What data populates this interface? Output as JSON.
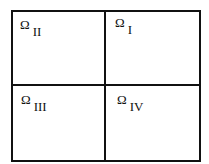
{
  "diagram": {
    "type": "domain-partition",
    "grid": {
      "rows": 2,
      "cols": 2
    },
    "regions": [
      {
        "position": "top-left",
        "symbol": "Ω",
        "subscript": "II"
      },
      {
        "position": "top-right",
        "symbol": "Ω",
        "subscript": "I"
      },
      {
        "position": "bottom-left",
        "symbol": "Ω",
        "subscript": "III"
      },
      {
        "position": "bottom-right",
        "symbol": "Ω",
        "subscript": "IV"
      }
    ],
    "colors": {
      "line": "#111111",
      "background": "#ffffff"
    }
  }
}
